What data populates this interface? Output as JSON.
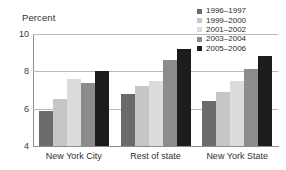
{
  "chart_data": {
    "type": "bar",
    "title": "",
    "subtitle": "",
    "xlabel": "",
    "ylabel": "Percent",
    "ylim": [
      4,
      10
    ],
    "yticks": [
      4,
      6,
      8,
      10
    ],
    "grid": true,
    "legend_position": "top-right",
    "categories": [
      "New York City",
      "Rest of state",
      "New York State"
    ],
    "series": [
      {
        "name": "1996–1997",
        "color": "#6b6b6b",
        "values": [
          5.9,
          6.8,
          6.4
        ]
      },
      {
        "name": "1999–2000",
        "color": "#c6c6c6",
        "values": [
          6.5,
          7.2,
          6.9
        ]
      },
      {
        "name": "2001–2002",
        "color": "#dcdcdc",
        "values": [
          7.6,
          7.5,
          7.5
        ]
      },
      {
        "name": "2003–2004",
        "color": "#8c8c8c",
        "values": [
          7.4,
          8.6,
          8.1
        ]
      },
      {
        "name": "2005–2006",
        "color": "#1c1c1c",
        "values": [
          8.0,
          9.2,
          8.8
        ]
      }
    ]
  },
  "axis": {
    "ylabel": "Percent",
    "tick_labels": [
      "10",
      "8",
      "6",
      "4"
    ]
  },
  "colors": {
    "grid": "#b9b9b9",
    "axis": "#8d8d8d",
    "text": "#2b2b2b",
    "background": "#ffffff"
  }
}
